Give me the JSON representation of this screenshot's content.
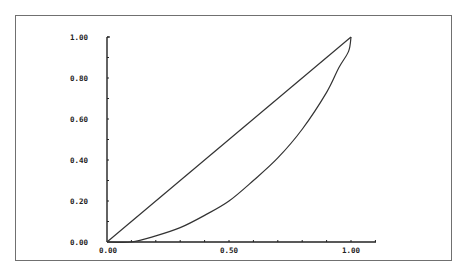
{
  "chart_data": {
    "type": "line",
    "title": "",
    "xlabel": "",
    "ylabel": "",
    "xlim": [
      0,
      1
    ],
    "ylim": [
      0,
      1
    ],
    "grid": false,
    "x_ticks": [
      "0.00",
      "0.50",
      "1.00"
    ],
    "y_ticks": [
      "0.00",
      "0.20",
      "0.40",
      "0.60",
      "0.80",
      "1.00"
    ],
    "series": [
      {
        "name": "line-of-equality",
        "x": [
          0.0,
          1.0
        ],
        "y": [
          0.0,
          1.0
        ]
      },
      {
        "name": "curve",
        "x": [
          0.0,
          0.1,
          0.2,
          0.3,
          0.4,
          0.5,
          0.6,
          0.7,
          0.8,
          0.9,
          0.95,
          0.99,
          1.0
        ],
        "y": [
          0.0,
          0.0,
          0.03,
          0.07,
          0.13,
          0.2,
          0.3,
          0.41,
          0.55,
          0.73,
          0.85,
          0.93,
          1.0
        ]
      }
    ]
  },
  "axes": {
    "x_labels": [
      "0.00",
      "0.50",
      "1.00"
    ],
    "y_labels": [
      "0.00",
      "0.20",
      "0.40",
      "0.60",
      "0.80",
      "1.00"
    ]
  },
  "colors": {
    "line": "#333333",
    "axis": "#222222",
    "frame": "#707070",
    "background": "#ffffff"
  }
}
